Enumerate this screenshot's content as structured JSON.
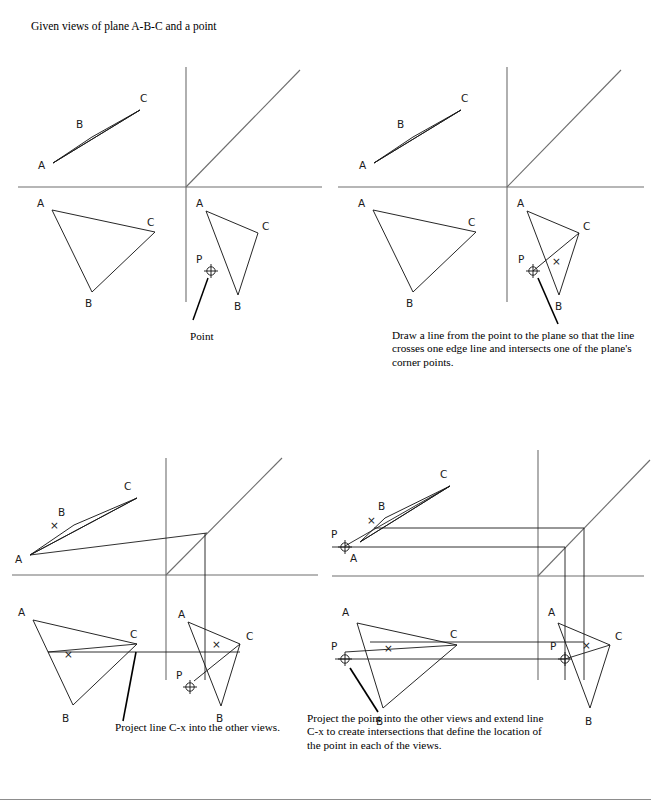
{
  "figure": {
    "title": "Given views of plane A-B-C and a point",
    "vertex_labels": {
      "a": "A",
      "b": "B",
      "c": "C",
      "p": "P",
      "x": "×"
    },
    "point_callout": "Point"
  },
  "panels": [
    {
      "id": "panel-1",
      "step": 1,
      "caption": "Point",
      "views": [
        "top",
        "front",
        "side"
      ],
      "shows": "Given top, front and side views of plane A-B-C plus point P in the side view"
    },
    {
      "id": "panel-2",
      "step": 2,
      "caption": "Draw a line from the point to the plane so that the line crosses one edge line and intersects one of the plane's corner points.",
      "views": [
        "top",
        "front",
        "side"
      ],
      "shows": "Line P to C drawn in side view crossing edge A-B at point x"
    },
    {
      "id": "panel-3",
      "step": 3,
      "caption": "Project line C-x into the other views.",
      "views": [
        "top",
        "front",
        "side"
      ],
      "shows": "Line C-x projected into top and front views with projection lines and miter line"
    },
    {
      "id": "panel-4",
      "step": 4,
      "caption": "Project the point into the other views and extend line C-x to create intersections that define the location of the point in each of the views.",
      "views": [
        "top",
        "front",
        "side"
      ],
      "shows": "Point P located in top, front and side views by extending line C-x"
    }
  ],
  "geometry": {
    "top_view": {
      "a": [
        53,
        163
      ],
      "b": [
        92,
        137
      ],
      "c": [
        140,
        110
      ]
    },
    "front_view": {
      "a": [
        52,
        210
      ],
      "b": [
        92,
        292
      ],
      "c": [
        155,
        232
      ]
    },
    "side_view": {
      "a": [
        206,
        211
      ],
      "b": [
        238,
        295
      ],
      "c": [
        258,
        233
      ]
    },
    "point_p_side": [
      211,
      271
    ],
    "axis_origin": [
      186,
      187
    ]
  },
  "colors": {
    "ink": "#1a1a1a",
    "axis": "#6e6e6e",
    "leader": "#000000",
    "rule": "#8d8d8d"
  }
}
